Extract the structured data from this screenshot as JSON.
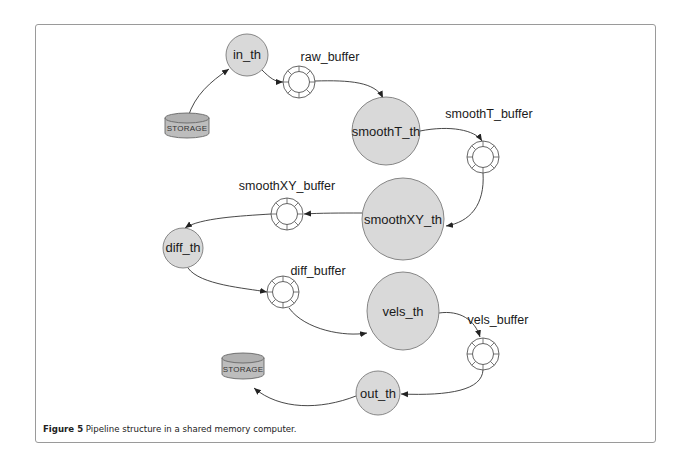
{
  "figure": {
    "caption_label": "Figure 5",
    "caption_text": " Pipeline structure in a shared memory computer."
  },
  "colors": {
    "thread_fill": "#d9d9d9",
    "thread_stroke": "#7a7a7a",
    "storage_fill": "#bdbdbd",
    "edge": "#333333",
    "frame": "#9a9a9a"
  },
  "nodes": {
    "storage_in": {
      "label": "STORAGE",
      "type": "storage"
    },
    "in_th": {
      "label": "in_th",
      "type": "thread"
    },
    "raw_buffer": {
      "label": "raw_buffer",
      "type": "buffer"
    },
    "smoothT_th": {
      "label": "smoothT_th",
      "type": "thread"
    },
    "smoothT_buffer": {
      "label": "smoothT_buffer",
      "type": "buffer"
    },
    "smoothXY_th": {
      "label": "smoothXY_th",
      "type": "thread"
    },
    "smoothXY_buffer": {
      "label": "smoothXY_buffer",
      "type": "buffer"
    },
    "diff_th": {
      "label": "diff_th",
      "type": "thread"
    },
    "diff_buffer": {
      "label": "diff_buffer",
      "type": "buffer"
    },
    "vels_th": {
      "label": "vels_th",
      "type": "thread"
    },
    "vels_buffer": {
      "label": "vels_buffer",
      "type": "buffer"
    },
    "out_th": {
      "label": "out_th",
      "type": "thread"
    },
    "storage_out": {
      "label": "STORAGE",
      "type": "storage"
    }
  },
  "edges": [
    [
      "storage_in",
      "in_th"
    ],
    [
      "in_th",
      "raw_buffer"
    ],
    [
      "raw_buffer",
      "smoothT_th"
    ],
    [
      "smoothT_th",
      "smoothT_buffer"
    ],
    [
      "smoothT_buffer",
      "smoothXY_th"
    ],
    [
      "smoothXY_th",
      "smoothXY_buffer"
    ],
    [
      "smoothXY_buffer",
      "diff_th"
    ],
    [
      "diff_th",
      "diff_buffer"
    ],
    [
      "diff_buffer",
      "vels_th"
    ],
    [
      "vels_th",
      "vels_buffer"
    ],
    [
      "vels_buffer",
      "out_th"
    ],
    [
      "out_th",
      "storage_out"
    ]
  ]
}
